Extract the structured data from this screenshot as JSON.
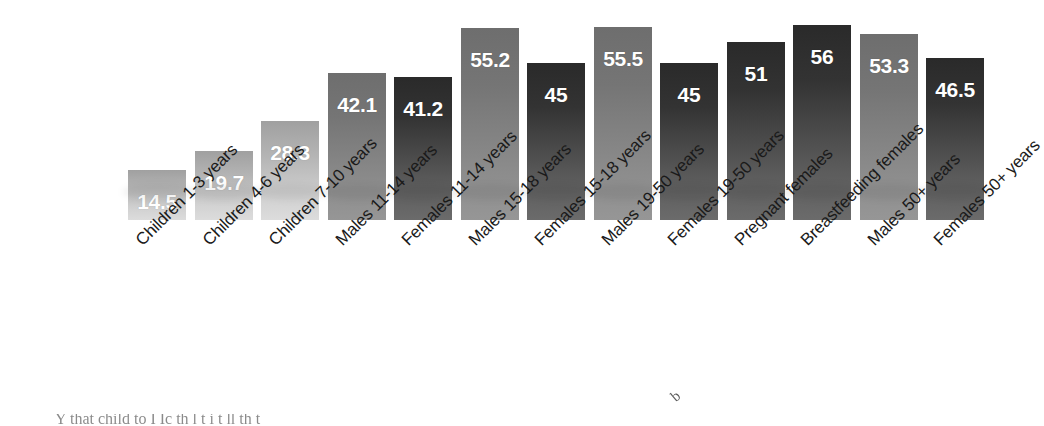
{
  "chart_data": {
    "type": "bar",
    "title": "",
    "subtitle": "",
    "xlabel": "",
    "ylabel": "",
    "ylim": [
      0,
      60
    ],
    "grid": false,
    "legend": "none",
    "categories": [
      "Children 1-3 years",
      "Children 4-6 years",
      "Children 7-10 years",
      "Males 11-14 years",
      "Females 11-14 years",
      "Males 15-18 years",
      "Females 15-18 years",
      "Males 19-50 years",
      "Females 19-50 years",
      "Pregnant females",
      "Breastfeeding females",
      "Males 50+ years",
      "Females 50+ years"
    ],
    "values": [
      14.5,
      19.7,
      28.3,
      42.1,
      41.2,
      55.2,
      45,
      55.5,
      45,
      51,
      56,
      53.3,
      46.5
    ],
    "value_labels": [
      "14.5",
      "19.7",
      "28.3",
      "42.1",
      "41.2",
      "55.2",
      "45",
      "55.5",
      "45",
      "51",
      "56",
      "53.3",
      "46.5"
    ],
    "bar_shades": [
      "light",
      "light",
      "light",
      "mid",
      "dark",
      "mid",
      "dark",
      "mid",
      "dark",
      "dark",
      "dark",
      "mid",
      "dark"
    ],
    "colors": {
      "light_top": "#a0a0a0",
      "light_bottom": "#dcdcdc",
      "mid_top": "#6e6e6e",
      "mid_bottom": "#969696",
      "dark_top": "#2a2a2a",
      "dark_bottom": "#6b6b6b",
      "value_label": "#ffffff",
      "category_label": "#1a1a1a",
      "background": "#ffffff"
    }
  },
  "footer": {
    "clipped_text": "Y               that   child        to I Ic  th             l                     t  i t    ll      th      t"
  },
  "stray": {
    "mark": "b"
  }
}
